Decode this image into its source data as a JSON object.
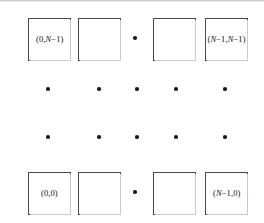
{
  "figure": {
    "name": "grid-cell-index-diagram",
    "background_color": "#ffffff",
    "stroke_color": "#4a4a4a",
    "dot_color": "#1b1b1b",
    "text_color": "#111111",
    "width": 264,
    "height": 223
  },
  "labels": {
    "top_left": "(0,N−1)",
    "top_left_parts": {
      "prefix": "(0,",
      "var": "N",
      "suffix": "−1)"
    },
    "top_right": "(N−1,N−1)",
    "top_right_parts": {
      "prefix": "(",
      "var1": "N",
      "mid": "−1,",
      "var2": "N",
      "suffix": "−1)"
    },
    "bottom_left": "(0,0)",
    "bottom_right": "(N−1,0)",
    "bottom_right_parts": {
      "prefix": "(",
      "var": "N",
      "suffix": "−1,0)"
    }
  },
  "grid": {
    "top_row_boxes": [
      {
        "name": "cell-0-N-1",
        "label_key": "top_left",
        "x": 28,
        "y": 18,
        "w": 43,
        "h": 43,
        "has_label": true
      },
      {
        "name": "cell-1-N-1",
        "label_key": "",
        "x": 78,
        "y": 18,
        "w": 43,
        "h": 43,
        "has_label": false
      },
      {
        "name": "cell-N-2-N-1",
        "label_key": "",
        "x": 153,
        "y": 18,
        "w": 43,
        "h": 43,
        "has_label": false
      },
      {
        "name": "cell-N-1-N-1",
        "label_key": "top_right",
        "x": 205,
        "y": 18,
        "w": 43,
        "h": 43,
        "has_label": true
      }
    ],
    "bottom_row_boxes": [
      {
        "name": "cell-0-0",
        "label_key": "bottom_left",
        "x": 28,
        "y": 172,
        "w": 43,
        "h": 43,
        "has_label": true
      },
      {
        "name": "cell-1-0",
        "label_key": "",
        "x": 78,
        "y": 172,
        "w": 43,
        "h": 43,
        "has_label": false
      },
      {
        "name": "cell-N-2-0",
        "label_key": "",
        "x": 153,
        "y": 172,
        "w": 43,
        "h": 43,
        "has_label": false
      },
      {
        "name": "cell-N-1-0",
        "label_key": "bottom_right",
        "x": 205,
        "y": 172,
        "w": 43,
        "h": 43,
        "has_label": true
      }
    ],
    "row_ellipsis_dots": [
      {
        "name": "ellipsis-dot-top-row",
        "x": 135,
        "y": 38
      },
      {
        "name": "ellipsis-dot-bottom-row",
        "x": 135,
        "y": 192
      }
    ],
    "middle_dot_rows": [
      {
        "name": "dot-row-upper",
        "y": 89,
        "dots_x": [
          48,
          99,
          137,
          176,
          225
        ]
      },
      {
        "name": "dot-row-lower",
        "y": 137,
        "dots_x": [
          48,
          99,
          137,
          176,
          225
        ]
      }
    ]
  }
}
